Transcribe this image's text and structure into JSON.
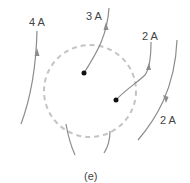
{
  "figure": {
    "caption": "(e)",
    "colors": {
      "wire": "#8c8c8c",
      "loop": "#bdbdbd",
      "dot": "#111111",
      "text": "#444444"
    },
    "amperian_loop": {
      "style": "dashed",
      "cx": 90,
      "cy": 90,
      "r": 47
    },
    "currents": [
      {
        "id": "wire-4a",
        "label": "4 A",
        "direction": "up"
      },
      {
        "id": "wire-3a",
        "label": "3 A",
        "direction": "up",
        "terminates_inside": true
      },
      {
        "id": "wire-2a-top",
        "label": "2 A",
        "direction": "up",
        "terminates_inside": true
      },
      {
        "id": "wire-2a-right",
        "label": "2 A",
        "direction": "down"
      },
      {
        "id": "wire-bottom-left",
        "label": ""
      },
      {
        "id": "wire-bottom-right",
        "label": ""
      }
    ]
  }
}
